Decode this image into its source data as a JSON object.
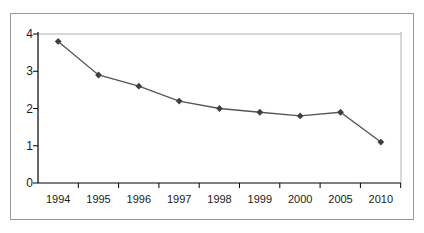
{
  "frame": {
    "border_color": "#9a9a9a",
    "background": "#ffffff"
  },
  "title_partial": "",
  "chart_data": {
    "type": "line",
    "title": "",
    "subtitle": "",
    "xlabel": "",
    "ylabel": "",
    "categories": [
      "1994",
      "1995",
      "1996",
      "1997",
      "1998",
      "1999",
      "2000",
      "2005",
      "2010"
    ],
    "values": [
      3.8,
      2.9,
      2.6,
      2.2,
      2.0,
      1.9,
      1.8,
      1.9,
      1.1
    ],
    "series": [
      {
        "name": "series-1",
        "values": [
          3.8,
          2.9,
          2.6,
          2.2,
          2.0,
          1.9,
          1.8,
          1.9,
          1.1
        ],
        "line_color": "#555555",
        "marker": "diamond",
        "marker_color": "#3f3f3f"
      }
    ],
    "ylim": [
      0,
      4
    ],
    "yticks": [
      0,
      1,
      2,
      3,
      4
    ],
    "ytick_labels": [
      "0",
      "1",
      "2",
      "3",
      "4"
    ],
    "grid": false,
    "top_gridline": true,
    "legend": false,
    "legend_position": "none",
    "axis_color": "#000000",
    "annotations": []
  },
  "axes": {
    "y_tick_labels": [
      "4",
      "3",
      "2",
      "1",
      "0"
    ],
    "x_tick_labels": [
      "1994",
      "1995",
      "1996",
      "1997",
      "1998",
      "1999",
      "2000",
      "2005",
      "2010"
    ]
  }
}
